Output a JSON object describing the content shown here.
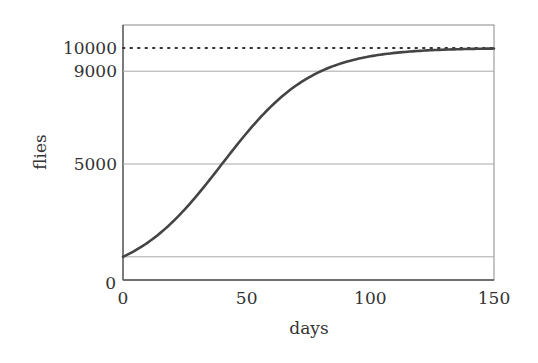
{
  "chart_data": {
    "type": "line",
    "title": "",
    "xlabel": "days",
    "ylabel": "flies",
    "xlim": [
      0,
      150
    ],
    "ylim": [
      0,
      10500
    ],
    "x_ticks": [
      0,
      50,
      100,
      150
    ],
    "y_ticks": [
      0,
      5000,
      9000,
      10000
    ],
    "x_tick_labels": [
      "0",
      "50",
      "100",
      "150"
    ],
    "y_tick_labels": [
      "0",
      "5000",
      "9000",
      "10000"
    ],
    "grid": "horizontal lines at y=1000, 5000, 9000; dotted line at y=10000",
    "reference_lines": [
      {
        "y": 10000,
        "style": "dotted",
        "label": "carrying capacity"
      },
      {
        "y": 9000,
        "style": "solid-light"
      },
      {
        "y": 5000,
        "style": "solid-light"
      },
      {
        "y": 1000,
        "style": "solid-light"
      }
    ],
    "model": {
      "kind": "logistic",
      "K": 10000,
      "N0": 1000,
      "r": 0.0549
    },
    "series": [
      {
        "name": "flies",
        "x": [
          0,
          10,
          20,
          30,
          40,
          50,
          60,
          70,
          80,
          90,
          100,
          110,
          120,
          130,
          140,
          150
        ],
        "values": [
          1000,
          1588,
          2437,
          3553,
          5000,
          6336,
          7539,
          8506,
          9000,
          9513,
          9720,
          9841,
          9910,
          9949,
          9971,
          9984
        ]
      }
    ],
    "colors": {
      "curve": "#444444",
      "grid": "#a8a8a8",
      "dotted": "#333333",
      "frame": "#777777"
    }
  }
}
